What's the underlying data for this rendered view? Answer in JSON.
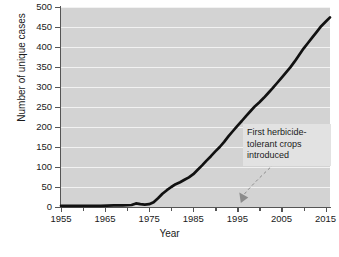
{
  "chart_data": {
    "type": "line",
    "title": "",
    "xlabel": "Year",
    "ylabel": "Number of unique cases",
    "xlim": [
      1955,
      2016
    ],
    "ylim": [
      0,
      500
    ],
    "grid": true,
    "legend": false,
    "x_ticks_major": [
      1955,
      1965,
      1975,
      1985,
      1995,
      2005,
      2015
    ],
    "x_ticks_minor": [
      1960,
      1970,
      1980,
      1990,
      2000,
      2010
    ],
    "y_ticks": [
      0,
      50,
      100,
      150,
      200,
      250,
      300,
      350,
      400,
      450,
      500
    ],
    "line_color": "#111111",
    "plot_background": "#d3d3d3",
    "gridline_color": "#f2f2f2",
    "series": [
      {
        "name": "Number of unique cases",
        "x": [
          1955,
          1958,
          1961,
          1964,
          1967,
          1969,
          1971,
          1972,
          1973,
          1974,
          1975,
          1976,
          1977,
          1978,
          1979,
          1980,
          1981,
          1982,
          1983,
          1984,
          1985,
          1986,
          1987,
          1988,
          1989,
          1990,
          1991,
          1992,
          1993,
          1994,
          1995,
          1996,
          1997,
          1998,
          1999,
          2000,
          2001,
          2002,
          2003,
          2004,
          2005,
          2006,
          2007,
          2008,
          2009,
          2010,
          2011,
          2012,
          2013,
          2014,
          2015,
          2016
        ],
        "values": [
          3,
          3,
          3,
          3,
          4,
          4,
          5,
          9,
          7,
          6,
          7,
          12,
          22,
          33,
          42,
          50,
          57,
          62,
          68,
          74,
          82,
          93,
          104,
          116,
          127,
          139,
          150,
          163,
          177,
          190,
          203,
          215,
          228,
          240,
          252,
          262,
          273,
          285,
          297,
          310,
          323,
          336,
          349,
          364,
          380,
          396,
          410,
          424,
          438,
          452,
          463,
          474
        ]
      }
    ],
    "annotations": [
      {
        "name": "herbicide-tolerant-crops",
        "lines": [
          "First herbicide-",
          "tolerant crops",
          "introduced"
        ],
        "points_to_year": 1996,
        "points_to_value": 0,
        "leader_style": "dashed-curve-with-arrowhead"
      }
    ]
  },
  "caption_fragment": ""
}
